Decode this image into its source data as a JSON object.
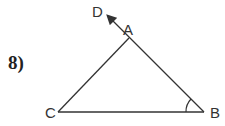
{
  "problem": {
    "number": "8)"
  },
  "diagram": {
    "type": "triangle with extended side",
    "vertices": [
      {
        "name": "A",
        "x": 129,
        "y": 38
      },
      {
        "name": "B",
        "x": 204,
        "y": 112
      },
      {
        "name": "C",
        "x": 58,
        "y": 112
      }
    ],
    "ray": {
      "from": "B",
      "through": "A",
      "to": "D",
      "label": "D"
    },
    "marked_angle": "B",
    "labels": {
      "A": "A",
      "B": "B",
      "C": "C",
      "D": "D"
    },
    "stroke_color": "#333333"
  }
}
